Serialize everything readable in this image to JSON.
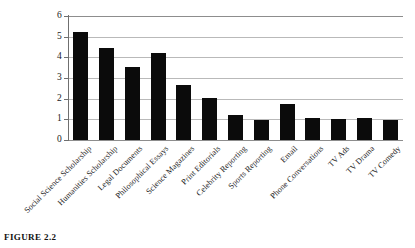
{
  "caption": "FIGURE 2.2",
  "chart_data": {
    "type": "bar",
    "title": "",
    "xlabel": "",
    "ylabel": "",
    "ylim": [
      0,
      6
    ],
    "yticks": [
      "0",
      "1",
      "2",
      "3",
      "4",
      "5",
      "6"
    ],
    "grid": true,
    "legend": false,
    "bar_color": "#0b0b0b",
    "grid_color": "#b9b9b9",
    "axis_color": "#6f6f6f",
    "categories": [
      "Social Science Scholarship",
      "Humanities Scholarship",
      "Legal Documents",
      "Philosophical Essays",
      "Science Magazines",
      "Print Editorials",
      "Celebrity Reporting",
      "Sports Reporting",
      "Email",
      "Phone Conversations",
      "TV Ads",
      "TV Drama",
      "TV Comedy"
    ],
    "values": [
      5.25,
      4.45,
      3.55,
      4.2,
      2.65,
      2.05,
      1.2,
      0.95,
      1.75,
      1.05,
      1.0,
      1.05,
      0.95
    ]
  }
}
